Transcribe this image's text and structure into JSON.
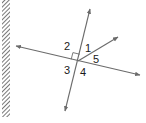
{
  "diagram": {
    "type": "geometry-angles",
    "colors": {
      "line": "#6b6b6b",
      "label": "#1a1a1a",
      "hatch": "#555555",
      "background": "#ffffff"
    },
    "wall": {
      "x": 2,
      "y": 0,
      "width": 8,
      "height": 117
    },
    "lines": [
      {
        "id": "line-steep",
        "x1": 65,
        "y1": 111,
        "x2": 90,
        "y2": 9,
        "arrows": "both"
      },
      {
        "id": "line-shallow",
        "x1": 16,
        "y1": 46,
        "x2": 140,
        "y2": 75,
        "arrows": "both"
      }
    ],
    "ray": {
      "id": "ray",
      "x1": 78,
      "y1": 61,
      "x2": 118,
      "y2": 37
    },
    "right_angle_marker": {
      "between": [
        "2"
      ],
      "at": [
        78,
        61
      ]
    },
    "angle_labels": [
      {
        "text": "1",
        "x": 85,
        "y": 52
      },
      {
        "text": "2",
        "x": 64,
        "y": 50
      },
      {
        "text": "3",
        "x": 64,
        "y": 74
      },
      {
        "text": "4",
        "x": 80,
        "y": 76
      },
      {
        "text": "5",
        "x": 93,
        "y": 63
      }
    ]
  }
}
